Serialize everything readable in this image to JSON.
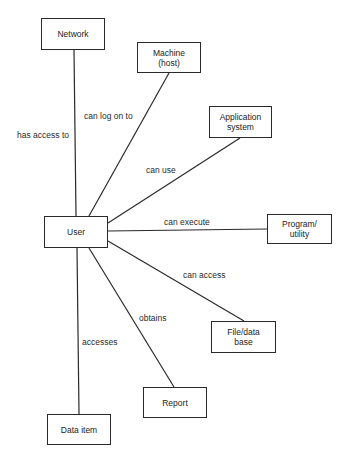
{
  "diagram": {
    "type": "entity-relationship",
    "center_node": "User",
    "nodes": [
      {
        "id": "network",
        "label": "Network",
        "x": 41,
        "y": 18,
        "w": 64,
        "h": 32
      },
      {
        "id": "machine",
        "label": "Machine\n(host)",
        "x": 137,
        "y": 42,
        "w": 64,
        "h": 31
      },
      {
        "id": "application",
        "label": "Application\nsystem",
        "x": 209,
        "y": 106,
        "w": 63,
        "h": 32
      },
      {
        "id": "user",
        "label": "User",
        "x": 44,
        "y": 216,
        "w": 64,
        "h": 32
      },
      {
        "id": "program",
        "label": "Program/\nutility",
        "x": 267,
        "y": 214,
        "w": 65,
        "h": 30
      },
      {
        "id": "file",
        "label": "File/data\nbase",
        "x": 211,
        "y": 321,
        "w": 65,
        "h": 32
      },
      {
        "id": "report",
        "label": "Report",
        "x": 143,
        "y": 387,
        "w": 64,
        "h": 31
      },
      {
        "id": "dataitem",
        "label": "Data item",
        "x": 47,
        "y": 414,
        "w": 64,
        "h": 31
      }
    ],
    "edges": [
      {
        "from": "user",
        "to": "network",
        "label": "has access to",
        "x1": 76,
        "y1": 216,
        "x2": 74,
        "y2": 50,
        "lx": 17,
        "ly": 130
      },
      {
        "from": "user",
        "to": "machine",
        "label": "can log on to",
        "x1": 89,
        "y1": 216,
        "x2": 169,
        "y2": 73,
        "lx": 84,
        "ly": 111
      },
      {
        "from": "user",
        "to": "application",
        "label": "can use",
        "x1": 108,
        "y1": 223,
        "x2": 240,
        "y2": 138,
        "lx": 146,
        "ly": 165
      },
      {
        "from": "user",
        "to": "program",
        "label": "can execute",
        "x1": 108,
        "y1": 231,
        "x2": 267,
        "y2": 229,
        "lx": 164,
        "ly": 217
      },
      {
        "from": "user",
        "to": "file",
        "label": "can access",
        "x1": 108,
        "y1": 241,
        "x2": 244,
        "y2": 321,
        "lx": 183,
        "ly": 270
      },
      {
        "from": "user",
        "to": "report",
        "label": "obtains",
        "x1": 89,
        "y1": 248,
        "x2": 174,
        "y2": 387,
        "lx": 139,
        "ly": 313
      },
      {
        "from": "user",
        "to": "dataitem",
        "label": "accesses",
        "x1": 77,
        "y1": 248,
        "x2": 79,
        "y2": 414,
        "lx": 82,
        "ly": 337
      }
    ]
  }
}
